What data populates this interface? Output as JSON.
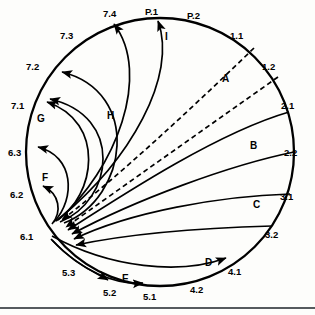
{
  "figure": {
    "type": "circular-flow-diagram",
    "background_color": "#fdfdfb",
    "line_color": "#000000",
    "rule_color": "#555a5e",
    "circle": {
      "cx": 160,
      "cy": 152,
      "r": 134
    },
    "focal_point": {
      "label": "6.1",
      "x": 50,
      "y": 227
    },
    "perimeter_labels": [
      {
        "id": "7.4",
        "text": "7.4",
        "x": 103,
        "y": 9
      },
      {
        "id": "P.1",
        "text": "P.1",
        "x": 145,
        "y": 7
      },
      {
        "id": "P.2",
        "text": "P.2",
        "x": 187,
        "y": 11
      },
      {
        "id": "1.1",
        "text": "1.1",
        "x": 230,
        "y": 31
      },
      {
        "id": "1.2",
        "text": "1.2",
        "x": 262,
        "y": 62
      },
      {
        "id": "2.1",
        "text": "2.1",
        "x": 281,
        "y": 101
      },
      {
        "id": "2.2",
        "text": "2.2",
        "x": 284,
        "y": 148
      },
      {
        "id": "3.1",
        "text": "3.1",
        "x": 280,
        "y": 192
      },
      {
        "id": "3.2",
        "text": "3.2",
        "x": 265,
        "y": 230
      },
      {
        "id": "4.1",
        "text": "4.1",
        "x": 228,
        "y": 267
      },
      {
        "id": "4.2",
        "text": "4.2",
        "x": 190,
        "y": 285
      },
      {
        "id": "5.1",
        "text": "5.1",
        "x": 143,
        "y": 292
      },
      {
        "id": "5.2",
        "text": "5.2",
        "x": 103,
        "y": 288
      },
      {
        "id": "5.3",
        "text": "5.3",
        "x": 62,
        "y": 268
      },
      {
        "id": "6.1",
        "text": "6.1",
        "x": 20,
        "y": 232
      },
      {
        "id": "6.2",
        "text": "6.2",
        "x": 10,
        "y": 190
      },
      {
        "id": "6.3",
        "text": "6.3",
        "x": 8,
        "y": 148
      },
      {
        "id": "7.1",
        "text": "7.1",
        "x": 11,
        "y": 101
      },
      {
        "id": "7.2",
        "text": "7.2",
        "x": 26,
        "y": 62
      },
      {
        "id": "7.3",
        "text": "7.3",
        "x": 60,
        "y": 31
      }
    ],
    "region_labels": [
      {
        "id": "A",
        "text": "A",
        "x": 222,
        "y": 74
      },
      {
        "id": "B",
        "text": "B",
        "x": 250,
        "y": 141
      },
      {
        "id": "C",
        "text": "C",
        "x": 253,
        "y": 200
      },
      {
        "id": "D",
        "text": "D",
        "x": 205,
        "y": 258
      },
      {
        "id": "E",
        "text": "E",
        "x": 122,
        "y": 274
      },
      {
        "id": "F",
        "text": "F",
        "x": 42,
        "y": 173
      },
      {
        "id": "G",
        "text": "G",
        "x": 37,
        "y": 114
      },
      {
        "id": "H",
        "text": "H",
        "x": 107,
        "y": 111
      },
      {
        "id": "I",
        "text": "I",
        "x": 165,
        "y": 32
      }
    ],
    "connectors": [
      {
        "id": "dashed-1-1",
        "style": "dashed",
        "from": "1.1",
        "to": "6.1",
        "arrow_at": "6.1"
      },
      {
        "id": "dashed-1-2",
        "style": "dashed",
        "from": "1.2",
        "to": "6.1",
        "arrow_at": "6.1"
      },
      {
        "id": "solid-2-1",
        "style": "solid",
        "from": "2.1",
        "to": "6.1",
        "arrow_at": "6.1"
      },
      {
        "id": "solid-2-2",
        "style": "solid",
        "from": "2.2",
        "to": "6.1",
        "arrow_at": "6.1"
      },
      {
        "id": "solid-3-1",
        "style": "solid",
        "from": "3.1",
        "to": "6.1",
        "arrow_at": "6.1"
      },
      {
        "id": "solid-3-2",
        "style": "solid",
        "from": "3.2",
        "to": "6.1",
        "arrow_at": "6.1"
      },
      {
        "id": "solid-4-1",
        "style": "solid",
        "from": "6.1",
        "to": "4.1",
        "arrow_at": "4.1"
      },
      {
        "id": "solid-5-1",
        "style": "solid",
        "from": "6.1",
        "to": "5.1",
        "arrow_at": "5.1"
      },
      {
        "id": "solid-5-2",
        "style": "solid",
        "from": "6.1",
        "to": "5.2",
        "arrow_at": "5.2"
      },
      {
        "id": "solid-6-2",
        "style": "solid",
        "from": "6.1",
        "to": "6.2",
        "arrow_at": "6.2"
      },
      {
        "id": "solid-6-3",
        "style": "solid",
        "from": "6.1",
        "to": "6.3",
        "arrow_at": "6.3"
      },
      {
        "id": "solid-7-1",
        "style": "solid",
        "from": "6.1",
        "to": "7.1",
        "arrow_at": "7.1"
      },
      {
        "id": "solid-7-1b",
        "style": "solid",
        "from": "6.1",
        "to": "7.1",
        "arrow_at": "7.1"
      },
      {
        "id": "solid-7-2",
        "style": "solid",
        "from": "6.1",
        "to": "7.2",
        "arrow_at": "7.2"
      },
      {
        "id": "solid-7-4",
        "style": "solid",
        "from": "6.1",
        "to": "7.4",
        "arrow_at": "7.4"
      },
      {
        "id": "solid-p-1",
        "style": "solid",
        "from": "6.1",
        "to": "P.1",
        "arrow_at": "P.1"
      }
    ]
  }
}
